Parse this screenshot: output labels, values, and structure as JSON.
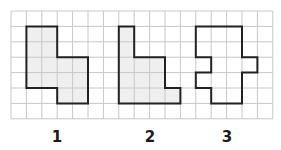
{
  "grid": {
    "origin_x": 11,
    "origin_y": 11,
    "cell": 15.4,
    "cols": 17,
    "rows": 7,
    "line_color": "#c8c8c8"
  },
  "shapes": [
    {
      "label": "1",
      "fill": "#efefef",
      "points": [
        [
          1,
          1
        ],
        [
          3,
          1
        ],
        [
          3,
          3
        ],
        [
          5,
          3
        ],
        [
          5,
          6
        ],
        [
          3,
          6
        ],
        [
          3,
          5
        ],
        [
          1,
          5
        ]
      ]
    },
    {
      "label": "2",
      "fill": "#efefef",
      "points": [
        [
          7,
          1
        ],
        [
          8,
          1
        ],
        [
          8,
          3
        ],
        [
          10,
          3
        ],
        [
          10,
          5
        ],
        [
          11,
          5
        ],
        [
          11,
          6
        ],
        [
          7,
          6
        ]
      ]
    },
    {
      "label": "3",
      "fill": "none",
      "points": [
        [
          12,
          1
        ],
        [
          15,
          1
        ],
        [
          15,
          3
        ],
        [
          16,
          3
        ],
        [
          16,
          4
        ],
        [
          15,
          4
        ],
        [
          15,
          6
        ],
        [
          13,
          6
        ],
        [
          13,
          5
        ],
        [
          12,
          5
        ],
        [
          12,
          4
        ],
        [
          13,
          4
        ],
        [
          13,
          3
        ],
        [
          12,
          3
        ]
      ]
    }
  ],
  "labels": [
    {
      "text": "1",
      "x": 57,
      "y": 128
    },
    {
      "text": "2",
      "x": 150,
      "y": 128
    },
    {
      "text": "3",
      "x": 227,
      "y": 128
    }
  ],
  "outline_color": "#222222"
}
